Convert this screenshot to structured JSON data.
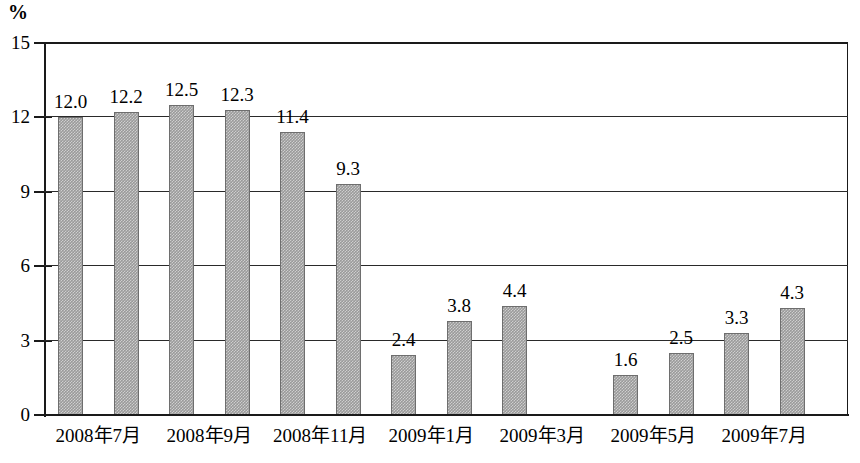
{
  "chart_data": {
    "type": "bar",
    "title": "",
    "subtitle": "",
    "xlabel": "",
    "ylabel": "%",
    "unit_label": "%",
    "ylim": [
      0,
      15
    ],
    "yticks": [
      0,
      3,
      6,
      9,
      12,
      15
    ],
    "ytick_labels": [
      "0",
      "3",
      "6",
      "9",
      "12",
      "15"
    ],
    "grid": true,
    "grid_axis": "y",
    "legend": false,
    "legend_position": "none",
    "bar_color": "#9a9a9a",
    "bar_edge_color": "#6e6e6e",
    "axis_color": "#1a1a1a",
    "categories": [
      "2008年7月",
      "2008年8月",
      "2008年9月",
      "2008年10月",
      "2008年11月",
      "2008年12月",
      "2009年1月",
      "2009年2月",
      "2009年3月",
      "2009年4月",
      "2009年5月",
      "2009年6月",
      "2009年7月",
      "2009年8月"
    ],
    "values": [
      12.0,
      12.2,
      12.5,
      12.3,
      11.4,
      9.3,
      2.4,
      3.8,
      4.4,
      null,
      1.6,
      2.5,
      3.3,
      4.3
    ],
    "data_labels": [
      "12.0",
      "12.2",
      "12.5",
      "12.3",
      "11.4",
      "9.3",
      "2.4",
      "3.8",
      "4.4",
      "",
      "1.6",
      "2.5",
      "3.3",
      "4.3"
    ],
    "visible_xtick_labels": [
      "2008年7月",
      "2008年9月",
      "2008年11月",
      "2009年1月",
      "2009年3月",
      "2009年5月",
      "2009年7月"
    ],
    "visible_xtick_indices": [
      0,
      2,
      4,
      6,
      8,
      10,
      12
    ]
  }
}
